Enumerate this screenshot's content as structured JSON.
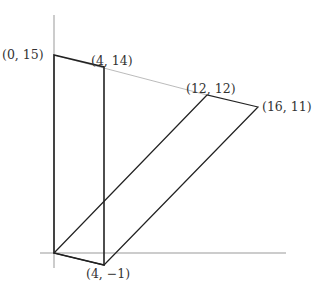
{
  "diagram": {
    "axes": {
      "x_axis": {
        "from": [
          40,
          253
        ],
        "to": [
          286,
          253
        ]
      },
      "y_axis": {
        "from": [
          54,
          15
        ],
        "to": [
          54,
          268
        ]
      }
    },
    "points": [
      {
        "id": "p0",
        "label": "(0, 15)",
        "coord": [
          0,
          15
        ],
        "px": [
          54,
          55
        ]
      },
      {
        "id": "p1",
        "label": "(4, 14)",
        "coord": [
          4,
          14
        ],
        "px": [
          104,
          67
        ]
      },
      {
        "id": "p2",
        "label": "(12, 12)",
        "coord": [
          12,
          12
        ],
        "px": [
          207,
          95
        ]
      },
      {
        "id": "p3",
        "label": "(16, 11)",
        "coord": [
          16,
          11
        ],
        "px": [
          258,
          107
        ]
      },
      {
        "id": "p4",
        "label": "(4, −1)",
        "coord": [
          4,
          -1
        ],
        "px": [
          104,
          265
        ]
      },
      {
        "id": "origin",
        "label": "",
        "coord": [
          0,
          0
        ],
        "px": [
          54,
          253
        ]
      }
    ],
    "labels": {
      "p0": "(0, 15)",
      "p1": "(4, 14)",
      "p2": "(12, 12)",
      "p3": "(16, 11)",
      "p4": "(4, −1)"
    },
    "colors": {
      "axis": "#999999",
      "shape": "#222222",
      "guide": "#aaaaaa"
    }
  }
}
